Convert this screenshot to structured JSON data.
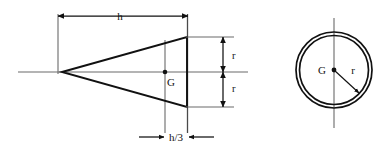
{
  "figure": {
    "background_color": "#ffffff",
    "line_color": "#111111",
    "thin_line_color": "#555555"
  },
  "cone_view": {
    "name": "side-elevation-of-cone",
    "labels": {
      "height": "h",
      "radius_upper": "r",
      "radius_lower": "r",
      "centroid": "G",
      "centroid_distance": "h/3"
    },
    "geometry": {
      "apex": [
        62,
        72
      ],
      "base_x": 187,
      "base_top_y": 37,
      "base_bottom_y": 107,
      "axis_start_x": 18,
      "axis_end_x": 248,
      "axis_y": 72,
      "centroid_point": [
        165,
        72
      ],
      "height_dim_y": 16,
      "height_dim_x1": 58,
      "height_dim_x2": 188,
      "radius_dim_x": 223,
      "h3_dim_y": 137,
      "h3_dim_x1": 165,
      "h3_dim_x2": 188
    }
  },
  "circle_view": {
    "name": "plan-view-circular-base",
    "labels": {
      "centroid": "G",
      "radius": "r"
    },
    "geometry": {
      "center": [
        334,
        70
      ],
      "outer_radius": 38,
      "inner_radius": 35,
      "centerline_top_y": 18,
      "centerline_bottom_y": 128,
      "radius_arrow_tip": [
        358,
        92
      ]
    }
  }
}
